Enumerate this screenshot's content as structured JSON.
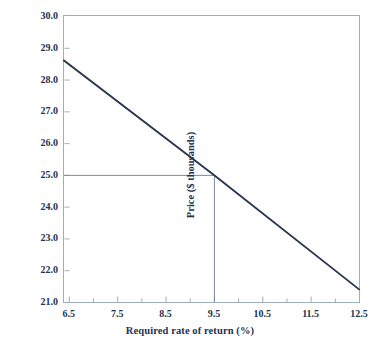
{
  "chart_data": {
    "type": "line",
    "title": "",
    "xlabel": "Required rate of return (%)",
    "ylabel": "Price ($ thousands)",
    "xlim": [
      6.4,
      12.5
    ],
    "ylim": [
      21.0,
      30.0
    ],
    "grid": false,
    "legend": null,
    "x_ticks": [
      "6.5",
      "7.5",
      "8.5",
      "9.5",
      "10.5",
      "11.5",
      "12.5"
    ],
    "x_tick_values": [
      6.5,
      7.5,
      8.5,
      9.5,
      10.5,
      11.5,
      12.5
    ],
    "x_minor_tick_values": [
      7.0,
      8.0,
      9.0,
      10.0,
      11.0,
      12.0
    ],
    "y_ticks": [
      "21.0",
      "22.0",
      "23.0",
      "24.0",
      "25.0",
      "26.0",
      "27.0",
      "28.0",
      "29.0",
      "30.0"
    ],
    "y_tick_values": [
      21.0,
      22.0,
      23.0,
      24.0,
      25.0,
      26.0,
      27.0,
      28.0,
      29.0,
      30.0
    ],
    "series": [
      {
        "name": "Price vs required rate of return",
        "x": [
          6.4,
          9.5,
          12.5
        ],
        "values": [
          28.6,
          25.0,
          21.4
        ]
      }
    ],
    "annotations": [
      {
        "name": "price-guide-horizontal",
        "type": "hline",
        "y": 25.0,
        "x_start": 6.4,
        "x_end": 9.5
      },
      {
        "name": "rate-guide-vertical",
        "type": "vline",
        "x": 9.5,
        "y_start": 21.0,
        "y_end": 25.0
      }
    ],
    "colors": {
      "line": "#2a3550",
      "guide": "#7c8ba3",
      "frame": "#9fadbf",
      "text": "#23324f",
      "background": "#ffffff"
    }
  }
}
